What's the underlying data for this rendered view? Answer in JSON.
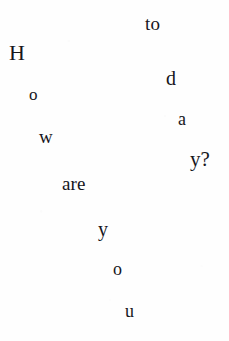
{
  "page": {
    "kind": "scanned-scattered-text",
    "full_phrase": "How are you doing today?",
    "background_color": "#fefefe",
    "text_color": "#16161c",
    "width": 229,
    "height": 341
  },
  "fragments": [
    {
      "id": "to",
      "text": "to",
      "x": 145,
      "y": 14,
      "size": 19
    },
    {
      "id": "H",
      "text": "H",
      "x": 9,
      "y": 42,
      "size": 22
    },
    {
      "id": "d",
      "text": "d",
      "x": 166,
      "y": 68,
      "size": 20
    },
    {
      "id": "o1",
      "text": "o",
      "x": 29,
      "y": 86,
      "size": 17
    },
    {
      "id": "a1",
      "text": "a",
      "x": 178,
      "y": 110,
      "size": 18
    },
    {
      "id": "w",
      "text": "w",
      "x": 39,
      "y": 127,
      "size": 19
    },
    {
      "id": "yq",
      "text": "y?",
      "x": 190,
      "y": 149,
      "size": 21
    },
    {
      "id": "are",
      "text": "are",
      "x": 62,
      "y": 174,
      "size": 19
    },
    {
      "id": "y2",
      "text": "y",
      "x": 98,
      "y": 219,
      "size": 20
    },
    {
      "id": "o2",
      "text": "o",
      "x": 113,
      "y": 260,
      "size": 18
    },
    {
      "id": "u",
      "text": "u",
      "x": 125,
      "y": 302,
      "size": 18
    }
  ]
}
